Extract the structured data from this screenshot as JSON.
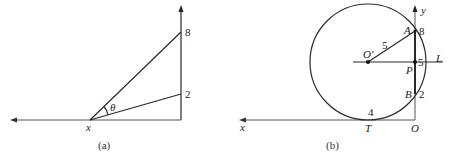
{
  "figure_a": {
    "caption": "(a)",
    "vertex_label": "x",
    "angle_label": "θ",
    "top_point_label": "8",
    "bottom_point_label": "2"
  },
  "figure_b": {
    "caption": "(b)",
    "x_axis_label": "x",
    "y_axis_label": "y",
    "center_label": "O'",
    "radius_label": "5",
    "point_A_label": "A",
    "point_P_label": "P",
    "point_B_label": "B",
    "point_T_label": "T",
    "origin_label": "O",
    "line_label": "L",
    "value_8": "8",
    "value_5": "5",
    "value_2": "2",
    "value_4": "4"
  },
  "colors": {
    "stroke": "#2a2a2a",
    "axis": "#555555",
    "background": "#ffffff"
  }
}
